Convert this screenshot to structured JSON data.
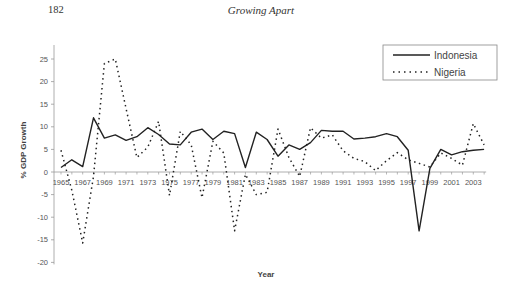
{
  "page": {
    "number": "182",
    "running_head": "Growing Apart"
  },
  "chart_data": {
    "type": "line",
    "title": "",
    "xlabel": "Year",
    "ylabel": "% GDP Growth",
    "ylim": [
      -20,
      25
    ],
    "yticks": [
      25,
      20,
      15,
      10,
      5,
      0,
      -5,
      -10,
      -15,
      -20
    ],
    "xtick_labels": [
      "1965",
      "1967",
      "1969",
      "1971",
      "1973",
      "1975",
      "1977",
      "1979",
      "1981",
      "1983",
      "1985",
      "1987",
      "1989",
      "1991",
      "1993",
      "1995",
      "1997",
      "1999",
      "2001",
      "2003"
    ],
    "grid": false,
    "legend_position": "top-right",
    "x": [
      1965,
      1966,
      1967,
      1968,
      1969,
      1970,
      1971,
      1972,
      1973,
      1974,
      1975,
      1976,
      1977,
      1978,
      1979,
      1980,
      1981,
      1982,
      1983,
      1984,
      1985,
      1986,
      1987,
      1988,
      1989,
      1990,
      1991,
      1992,
      1993,
      1994,
      1995,
      1996,
      1997,
      1998,
      1999,
      2000,
      2001,
      2002,
      2003,
      2004
    ],
    "series": [
      {
        "name": "Indonesia",
        "style": "solid",
        "color": "#222222",
        "values": [
          1.0,
          2.7,
          1.2,
          12.0,
          7.5,
          8.2,
          7.0,
          7.8,
          9.8,
          8.3,
          6.2,
          6.0,
          8.8,
          9.5,
          7.2,
          9.0,
          8.5,
          1.0,
          8.8,
          7.2,
          3.5,
          6.0,
          5.0,
          6.5,
          9.2,
          9.0,
          9.0,
          7.3,
          7.5,
          7.8,
          8.5,
          7.8,
          4.8,
          -13.0,
          0.8,
          5.0,
          3.8,
          4.5,
          4.8,
          5.0
        ]
      },
      {
        "name": "Nigeria",
        "style": "dotted",
        "color": "#222222",
        "values": [
          4.8,
          -4.0,
          -15.7,
          -1.0,
          24.0,
          25.0,
          14.0,
          3.2,
          5.5,
          11.2,
          -5.2,
          9.0,
          6.0,
          -5.7,
          6.8,
          4.2,
          -13.0,
          -0.5,
          -5.0,
          -4.5,
          9.5,
          3.2,
          -1.0,
          9.8,
          7.5,
          8.2,
          4.7,
          3.0,
          2.3,
          0.3,
          2.5,
          4.3,
          2.7,
          1.9,
          1.1,
          4.2,
          3.0,
          1.5,
          10.7,
          6.0
        ]
      }
    ]
  }
}
